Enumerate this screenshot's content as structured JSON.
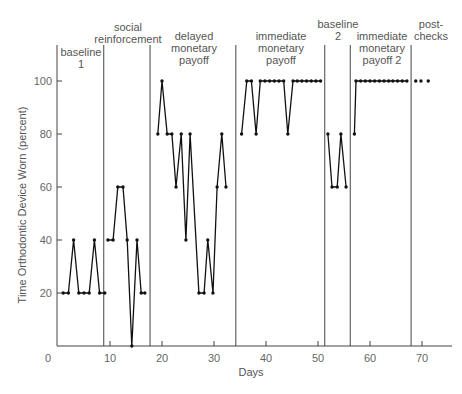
{
  "chart_data": {
    "type": "line",
    "title": "",
    "xlabel": "Days",
    "ylabel": "Time Orthodontic Device Worn (percent)",
    "xlim": [
      0,
      75
    ],
    "ylim": [
      0,
      110
    ],
    "x_ticks": [
      0,
      10,
      20,
      30,
      40,
      50,
      60,
      70
    ],
    "y_ticks": [
      20,
      40,
      60,
      80,
      100
    ],
    "grid": false,
    "legend": null,
    "phase_lines_x": [
      8.8,
      17.7,
      34.2,
      51.3,
      56.2,
      67.9
    ],
    "phases": [
      {
        "name": "baseline 1",
        "label_lines": [
          "baseline",
          "1"
        ],
        "x": [
          1,
          2,
          3,
          4,
          5,
          6,
          7,
          8,
          9
        ],
        "y": [
          20,
          20,
          40,
          20,
          20,
          20,
          40,
          20,
          20
        ]
      },
      {
        "name": "social reinforcement",
        "label_lines": [
          "social",
          "reinforcement"
        ],
        "x": [
          9.6,
          10.6,
          11.5,
          12.5,
          13.3,
          14.2,
          15.2,
          16.0,
          16.7
        ],
        "y": [
          40,
          40,
          60,
          60,
          40,
          0,
          40,
          20,
          20
        ]
      },
      {
        "name": "delayed monetary payoff",
        "label_lines": [
          "delayed",
          "monetary",
          "payoff"
        ],
        "x": [
          19.2,
          20.0,
          21.0,
          21.9,
          22.7,
          23.7,
          24.6,
          25.4,
          27.1,
          28.1,
          28.8,
          29.8,
          30.6,
          31.5,
          32.3
        ],
        "y": [
          80,
          100,
          80,
          80,
          60,
          80,
          40,
          80,
          20,
          20,
          40,
          20,
          60,
          80,
          60
        ]
      },
      {
        "name": "immediate monetary payoff",
        "label_lines": [
          "immediate",
          "monetary",
          "payoff"
        ],
        "x": [
          35.3,
          36.3,
          37.2,
          38.1,
          38.9,
          39.8,
          40.7,
          41.6,
          42.5,
          43.4,
          44.2,
          45.2,
          46.0,
          46.9,
          47.8,
          48.7,
          49.6,
          50.5
        ],
        "y": [
          80,
          100,
          100,
          80,
          100,
          100,
          100,
          100,
          100,
          100,
          80,
          100,
          100,
          100,
          100,
          100,
          100,
          100
        ]
      },
      {
        "name": "baseline 2",
        "label_lines": [
          "baseline",
          "2"
        ],
        "x": [
          51.9,
          52.7,
          53.7,
          54.4,
          55.4
        ],
        "y": [
          80,
          60,
          60,
          80,
          60
        ]
      },
      {
        "name": "immediate monetary payoff 2",
        "label_lines": [
          "immediate",
          "monetary",
          "payoff 2"
        ],
        "x": [
          57.0,
          57.3,
          58.2,
          59.1,
          60.0,
          60.9,
          61.8,
          62.7,
          63.6,
          64.4,
          65.3,
          66.2,
          67.1
        ],
        "y": [
          80,
          100,
          100,
          100,
          100,
          100,
          100,
          100,
          100,
          100,
          100,
          100,
          100
        ]
      },
      {
        "name": "post-checks",
        "label_lines": [
          "post-",
          "checks"
        ],
        "x": [
          68.8,
          69.8,
          71.2
        ],
        "y": [
          100,
          100,
          100
        ],
        "connected": false
      }
    ]
  },
  "axes": {
    "xlabel": "Days",
    "ylabel": "Time Orthodontic Device Worn (percent)",
    "x_tick_labels": [
      "0",
      "10",
      "20",
      "30",
      "40",
      "50",
      "60",
      "70"
    ],
    "y_tick_labels": [
      "20",
      "40",
      "60",
      "80",
      "100"
    ]
  },
  "colors": {
    "line": "#111111",
    "axis": "#444444",
    "text": "#555555"
  }
}
